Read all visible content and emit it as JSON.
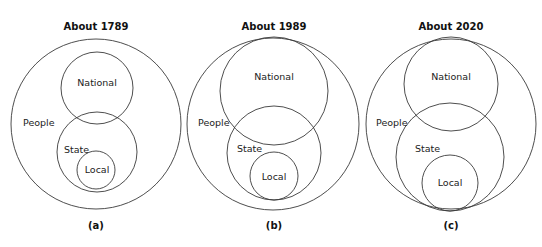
{
  "panels": [
    {
      "title": "About 1789",
      "caption": "(a)",
      "labels": {
        "people": "People",
        "national": "National",
        "state": "State",
        "local": "Local"
      },
      "circles": {
        "people": {
          "cx": 96,
          "cy": 124,
          "r": 85
        },
        "national": {
          "cx": 97,
          "cy": 88,
          "r": 36
        },
        "state": {
          "cx": 97,
          "cy": 152,
          "r": 40
        },
        "local": {
          "cx": 96,
          "cy": 170,
          "r": 19
        }
      }
    },
    {
      "title": "About 1989",
      "caption": "(b)",
      "labels": {
        "people": "People",
        "national": "National",
        "state": "State",
        "local": "Local"
      },
      "circles": {
        "people": {
          "cx": 273,
          "cy": 124,
          "r": 86
        },
        "national": {
          "cx": 274,
          "cy": 91,
          "r": 54
        },
        "state": {
          "cx": 274,
          "cy": 153,
          "r": 47
        },
        "local": {
          "cx": 274,
          "cy": 176,
          "r": 24
        }
      }
    },
    {
      "title": "About 2020",
      "caption": "(c)",
      "labels": {
        "people": "People",
        "national": "National",
        "state": "State",
        "local": "Local"
      },
      "circles": {
        "people": {
          "cx": 451,
          "cy": 124,
          "r": 85
        },
        "national": {
          "cx": 451,
          "cy": 84,
          "r": 47
        },
        "state": {
          "cx": 450,
          "cy": 157,
          "r": 54
        },
        "local": {
          "cx": 450,
          "cy": 183,
          "r": 28
        }
      }
    }
  ]
}
